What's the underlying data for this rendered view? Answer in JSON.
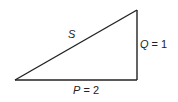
{
  "diagram": {
    "type": "right-triangle",
    "vertices": {
      "bottom_left": [
        15,
        80
      ],
      "bottom_right": [
        137,
        80
      ],
      "top_right": [
        137,
        10
      ]
    },
    "labels": {
      "hypotenuse": {
        "var": "S",
        "value": ""
      },
      "vertical_side": {
        "var": "Q",
        "eq": " = 1"
      },
      "horizontal_side": {
        "var": "P",
        "eq": " = 2"
      }
    },
    "stroke_color": "#222222"
  }
}
